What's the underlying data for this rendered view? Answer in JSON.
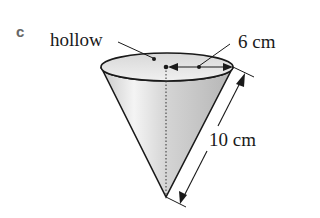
{
  "part_label": "c",
  "labels": {
    "hollow": "hollow",
    "radius": "6 cm",
    "slant": "10 cm"
  },
  "colors": {
    "line": "#1a1a1a",
    "cone_light": "#f2f2f2",
    "cone_mid": "#cfcfcf",
    "cone_dark": "#b8b8b8",
    "top_ellipse": "#e6e6e6",
    "part_label": "#666666"
  }
}
